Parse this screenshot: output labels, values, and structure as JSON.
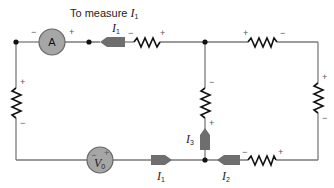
{
  "title": {
    "text": "To measure ",
    "var": "I",
    "sub": "1"
  },
  "ammeter": {
    "label": "A",
    "minus": "−",
    "plus": "+"
  },
  "source": {
    "var": "V",
    "sub": "0",
    "minus": "−",
    "plus": "+"
  },
  "currents": {
    "top_i1": {
      "var": "I",
      "sub": "1"
    },
    "bottom_i1": {
      "var": "I",
      "sub": "1"
    },
    "i2": {
      "var": "I",
      "sub": "2"
    },
    "i3": {
      "var": "I",
      "sub": "3"
    }
  },
  "polarity": {
    "plus": "+",
    "minus": "−"
  },
  "colors": {
    "wire": "#7a7a7a",
    "meter_fill": "#a6a6a6",
    "arrow": "#6e6e6e",
    "resistor": "#111111"
  }
}
